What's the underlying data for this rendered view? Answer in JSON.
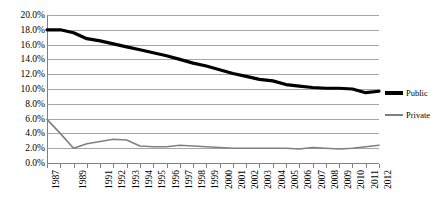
{
  "chart_data": {
    "type": "line",
    "title": "",
    "xlabel": "",
    "ylabel": "",
    "ylim": [
      0,
      20
    ],
    "ytick_labels": [
      "20.0%",
      "18.0%",
      "16.0%",
      "14.0%",
      "12.0%",
      "10.0%",
      "8.0%",
      "6.0%",
      "4.0%",
      "2.0%",
      "0.0%"
    ],
    "ytick_values": [
      20,
      18,
      16,
      14,
      12,
      10,
      8,
      6,
      4,
      2,
      0
    ],
    "grid": true,
    "legend_position": "right",
    "x": [
      1987,
      1988,
      1989,
      1990,
      1991,
      1992,
      1993,
      1994,
      1995,
      1996,
      1997,
      1998,
      1999,
      2000,
      2001,
      2002,
      2003,
      2004,
      2005,
      2006,
      2007,
      2008,
      2009,
      2010,
      2011,
      2012
    ],
    "xtick_labels": [
      "1987",
      "",
      "1989",
      "",
      "1991",
      "1992",
      "1993",
      "1994",
      "1995",
      "1996",
      "1997",
      "1998",
      "1999",
      "2000",
      "2001",
      "2002",
      "2003",
      "2004",
      "2005",
      "2006",
      "2007",
      "2008",
      "2009",
      "2010",
      "2011",
      "2012"
    ],
    "series": [
      {
        "name": "Public",
        "color": "#000000",
        "width": 3.2,
        "values": [
          18.0,
          18.0,
          17.6,
          16.8,
          16.5,
          16.1,
          15.7,
          15.3,
          14.9,
          14.5,
          14.0,
          13.5,
          13.1,
          12.6,
          12.1,
          11.7,
          11.3,
          11.1,
          10.6,
          10.4,
          10.2,
          10.1,
          10.1,
          10.0,
          9.5,
          9.7
        ]
      },
      {
        "name": "Private",
        "color": "#808080",
        "width": 1.6,
        "values": [
          5.9,
          4.0,
          2.0,
          2.6,
          2.9,
          3.2,
          3.1,
          2.3,
          2.2,
          2.2,
          2.4,
          2.3,
          2.2,
          2.1,
          2.0,
          2.0,
          2.0,
          2.0,
          2.0,
          1.9,
          2.1,
          2.0,
          1.9,
          2.0,
          2.2,
          2.4
        ]
      }
    ]
  },
  "legend": {
    "entries": [
      {
        "label": "Public"
      },
      {
        "label": "Private"
      }
    ]
  }
}
